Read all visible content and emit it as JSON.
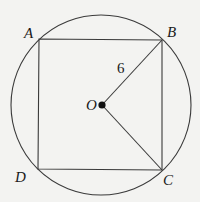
{
  "figure": {
    "type": "square inscribed in circle",
    "circle": {
      "center_label": "O",
      "cx": 101,
      "cy": 105,
      "r": 90
    },
    "vertices": [
      {
        "label": "A",
        "x": 39,
        "y": 39,
        "lx": 24,
        "ly": 38
      },
      {
        "label": "B",
        "x": 162,
        "y": 40,
        "lx": 167,
        "ly": 37
      },
      {
        "label": "C",
        "x": 162,
        "y": 170,
        "lx": 163,
        "ly": 185
      },
      {
        "label": "D",
        "x": 38,
        "y": 169,
        "lx": 15,
        "ly": 182
      }
    ],
    "center": {
      "label": "O",
      "x": 102,
      "y": 105,
      "lx": 86,
      "ly": 110
    },
    "segments": [
      {
        "from": "O",
        "to": "B",
        "label": "6",
        "lx": 117,
        "ly": 73
      },
      {
        "from": "O",
        "to": "C",
        "label": ""
      }
    ],
    "colors": {
      "stroke": "#3a3a3a",
      "background": "#f3f3f1"
    }
  }
}
